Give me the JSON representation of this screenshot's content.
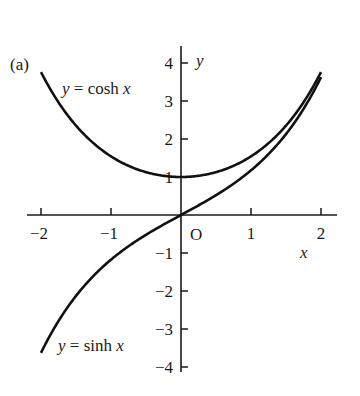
{
  "chart_data": {
    "type": "line",
    "panel_label": "(a)",
    "title": "",
    "xlabel": "x",
    "ylabel": "y",
    "origin_label": "O",
    "xlim": [
      -2.2,
      2.2
    ],
    "ylim": [
      -4.1,
      4.4
    ],
    "grid": false,
    "legend": "none (inline curve labels)",
    "x_ticks": [
      -2,
      -1,
      1,
      2
    ],
    "x_tick_labels": [
      "−2",
      "−1",
      "1",
      "2"
    ],
    "y_ticks": [
      -4,
      -3,
      -2,
      -1,
      1,
      2,
      3,
      4
    ],
    "y_tick_labels": [
      "−4",
      "−3",
      "−2",
      "−1",
      "1",
      "2",
      "3",
      "4"
    ],
    "series": [
      {
        "name": "y = cosh x",
        "label_prefix": "y",
        "label_eq": " = cosh ",
        "label_var": "x",
        "function": "cosh",
        "x": [
          -2,
          -1.5,
          -1,
          -0.5,
          0,
          0.5,
          1,
          1.5,
          2
        ],
        "values": [
          3.76,
          2.35,
          1.54,
          1.13,
          1.0,
          1.13,
          1.54,
          2.35,
          3.76
        ]
      },
      {
        "name": "y = sinh x",
        "label_prefix": "y",
        "label_eq": " = sinh ",
        "label_var": "x",
        "function": "sinh",
        "x": [
          -2,
          -1.5,
          -1,
          -0.5,
          0,
          0.5,
          1,
          1.5,
          2
        ],
        "values": [
          -3.63,
          -2.13,
          -1.18,
          -0.52,
          0.0,
          0.52,
          1.18,
          2.13,
          3.63
        ]
      }
    ]
  }
}
